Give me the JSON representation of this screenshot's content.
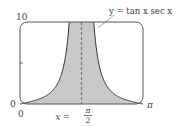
{
  "chart_data": {
    "type": "area",
    "title": "",
    "function_label": "y = tan x sec x",
    "asymptote_label": "x = π/2",
    "asymptote": {
      "x_num": "π",
      "x_den": "2",
      "x_prefix": "x ="
    },
    "xlabel": "",
    "ylabel": "",
    "xlim": [
      0,
      3.14159
    ],
    "ylim": [
      0,
      10
    ],
    "x_ticks": [
      {
        "value": 0,
        "label": "0"
      },
      {
        "value": 3.14159,
        "label": "π"
      }
    ],
    "y_ticks": [
      {
        "value": 0,
        "label": "0"
      },
      {
        "value": 5,
        "label": ""
      },
      {
        "value": 10,
        "label": "10"
      }
    ],
    "grid": false,
    "shaded_region": "between y=0 and y=|tan x sec x| on [0, π], clipped at y=10",
    "series": [
      {
        "name": "y = tan x sec x",
        "x": [
          0,
          0.2,
          0.4,
          0.6,
          0.8,
          1.0,
          1.1,
          1.2,
          1.26
        ],
        "y": [
          0,
          0.21,
          0.46,
          0.83,
          1.48,
          2.88,
          4.63,
          7.12,
          10
        ]
      }
    ],
    "colors": {
      "fill": "#c9c9c9",
      "curve": "#333333",
      "frame": "#555555",
      "asymptote": "#777777"
    }
  },
  "labels": {
    "y_top": "10",
    "y_zero": "0",
    "x_zero": "0",
    "x_pi": "π",
    "func": "y = tan x sec x",
    "asym_prefix": "x =",
    "asym_num": "π",
    "asym_den": "2"
  }
}
